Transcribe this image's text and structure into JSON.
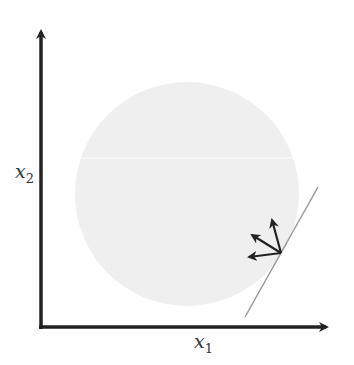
{
  "diagram": {
    "axes": {
      "x_label": {
        "base": "x",
        "sub": "1"
      },
      "y_label": {
        "base": "x",
        "sub": "2"
      },
      "origin": [
        41,
        327
      ],
      "x_tip": [
        333,
        327
      ],
      "y_tip": [
        41,
        24
      ],
      "color": "#222222"
    },
    "disc": {
      "cx": 187,
      "cy": 194,
      "r": 112,
      "fill": "#efefef"
    },
    "tangent_line": {
      "from": [
        318,
        187
      ],
      "to": [
        245,
        317
      ],
      "color": "#999999"
    },
    "boundary_point": [
      281,
      253
    ],
    "arrows": [
      {
        "name": "arrow-up",
        "to": [
          272,
          218
        ]
      },
      {
        "name": "arrow-up-left",
        "to": [
          250,
          234
        ]
      },
      {
        "name": "arrow-left",
        "to": [
          247,
          257
        ]
      }
    ],
    "arrow_color": "#222222"
  }
}
